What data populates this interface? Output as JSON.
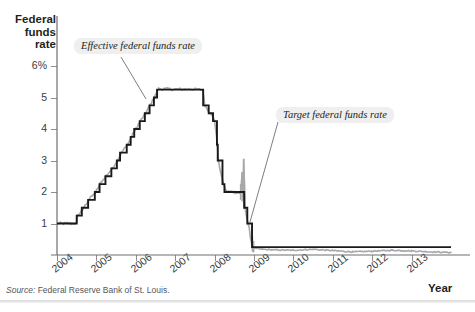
{
  "figure": {
    "cut_title": "",
    "source": "Source: Federal Reserve Bank of St. Louis."
  },
  "axes": {
    "y_title": "Federal funds rate",
    "x_title": "Year"
  },
  "callouts": {
    "effective": "Effective federal funds rate",
    "target": "Target federal funds rate"
  },
  "colors": {
    "target_line": "#1a1a1a",
    "effective_line": "#a8a8ab",
    "axis": "#6f6f72",
    "callout_bg": "#efefef",
    "text": "#231f20"
  },
  "chart_data": {
    "type": "line",
    "title": "",
    "xlabel": "Year",
    "ylabel": "Federal funds rate",
    "xlim": [
      2004,
      2014
    ],
    "ylim": [
      0,
      6.6
    ],
    "ytick_labels": [
      "6%",
      "5",
      "4",
      "3",
      "2",
      "1"
    ],
    "ytick_values": [
      6,
      5,
      4,
      3,
      2,
      1
    ],
    "xtick_labels": [
      "2004",
      "2005",
      "2006",
      "2007",
      "2008",
      "2009",
      "2010",
      "2011",
      "2012",
      "2013"
    ],
    "xtick_values": [
      2004,
      2005,
      2006,
      2007,
      2008,
      2009,
      2010,
      2011,
      2012,
      2013
    ],
    "grid": false,
    "legend": "annotations",
    "series": [
      {
        "name": "Target federal funds rate",
        "color": "#1a1a1a",
        "style": "step",
        "points": [
          [
            2004.0,
            1.0
          ],
          [
            2004.5,
            1.0
          ],
          [
            2004.5,
            1.25
          ],
          [
            2004.63,
            1.25
          ],
          [
            2004.63,
            1.5
          ],
          [
            2004.79,
            1.5
          ],
          [
            2004.79,
            1.75
          ],
          [
            2004.96,
            1.75
          ],
          [
            2004.96,
            2.0
          ],
          [
            2005.08,
            2.0
          ],
          [
            2005.08,
            2.25
          ],
          [
            2005.23,
            2.25
          ],
          [
            2005.23,
            2.5
          ],
          [
            2005.38,
            2.5
          ],
          [
            2005.38,
            2.75
          ],
          [
            2005.52,
            2.75
          ],
          [
            2005.52,
            3.0
          ],
          [
            2005.6,
            3.0
          ],
          [
            2005.6,
            3.25
          ],
          [
            2005.77,
            3.25
          ],
          [
            2005.77,
            3.5
          ],
          [
            2005.87,
            3.5
          ],
          [
            2005.87,
            3.75
          ],
          [
            2005.96,
            3.75
          ],
          [
            2005.96,
            4.0
          ],
          [
            2006.1,
            4.0
          ],
          [
            2006.1,
            4.25
          ],
          [
            2006.23,
            4.25
          ],
          [
            2006.23,
            4.5
          ],
          [
            2006.35,
            4.5
          ],
          [
            2006.35,
            4.75
          ],
          [
            2006.46,
            4.75
          ],
          [
            2006.46,
            5.0
          ],
          [
            2006.54,
            5.0
          ],
          [
            2006.54,
            5.25
          ],
          [
            2007.71,
            5.25
          ],
          [
            2007.71,
            4.75
          ],
          [
            2007.85,
            4.75
          ],
          [
            2007.85,
            4.5
          ],
          [
            2007.96,
            4.5
          ],
          [
            2007.96,
            4.25
          ],
          [
            2008.06,
            4.25
          ],
          [
            2008.06,
            3.5
          ],
          [
            2008.08,
            3.5
          ],
          [
            2008.08,
            3.0
          ],
          [
            2008.2,
            3.0
          ],
          [
            2008.2,
            2.25
          ],
          [
            2008.25,
            2.25
          ],
          [
            2008.25,
            2.0
          ],
          [
            2008.75,
            2.0
          ],
          [
            2008.75,
            1.5
          ],
          [
            2008.83,
            1.5
          ],
          [
            2008.83,
            1.0
          ],
          [
            2008.95,
            1.0
          ],
          [
            2008.95,
            0.25
          ],
          [
            2014.0,
            0.25
          ]
        ]
      },
      {
        "name": "Effective federal funds rate",
        "color": "#a8a8ab",
        "style": "noisy",
        "description": "Tracks the target closely with small daily fluctuations; spikes to ~3.0 in late 2008 and drifts to roughly 0.10-0.20 after 2009.",
        "points": [
          [
            2004.0,
            1.0
          ],
          [
            2004.5,
            1.0
          ],
          [
            2004.52,
            1.26
          ],
          [
            2004.65,
            1.43
          ],
          [
            2004.8,
            1.76
          ],
          [
            2004.98,
            1.98
          ],
          [
            2005.1,
            2.28
          ],
          [
            2005.25,
            2.52
          ],
          [
            2005.4,
            2.74
          ],
          [
            2005.55,
            3.04
          ],
          [
            2005.62,
            3.22
          ],
          [
            2005.8,
            3.52
          ],
          [
            2005.9,
            3.78
          ],
          [
            2006.0,
            4.0
          ],
          [
            2006.12,
            4.26
          ],
          [
            2006.25,
            4.5
          ],
          [
            2006.37,
            4.78
          ],
          [
            2006.48,
            5.02
          ],
          [
            2006.58,
            5.28
          ],
          [
            2007.0,
            5.26
          ],
          [
            2007.4,
            5.27
          ],
          [
            2007.7,
            5.24
          ],
          [
            2007.75,
            4.76
          ],
          [
            2007.88,
            4.52
          ],
          [
            2008.0,
            4.28
          ],
          [
            2008.07,
            3.48
          ],
          [
            2008.1,
            2.96
          ],
          [
            2008.22,
            2.26
          ],
          [
            2008.3,
            2.02
          ],
          [
            2008.5,
            2.0
          ],
          [
            2008.66,
            1.96
          ],
          [
            2008.7,
            2.62
          ],
          [
            2008.72,
            1.9
          ],
          [
            2008.74,
            3.0
          ],
          [
            2008.78,
            1.45
          ],
          [
            2008.86,
            0.95
          ],
          [
            2008.96,
            0.22
          ],
          [
            2009.2,
            0.18
          ],
          [
            2009.6,
            0.16
          ],
          [
            2010.0,
            0.15
          ],
          [
            2010.5,
            0.18
          ],
          [
            2011.0,
            0.14
          ],
          [
            2011.5,
            0.1
          ],
          [
            2012.0,
            0.12
          ],
          [
            2012.5,
            0.15
          ],
          [
            2013.0,
            0.13
          ],
          [
            2013.5,
            0.1
          ],
          [
            2014.0,
            0.08
          ]
        ]
      }
    ]
  }
}
